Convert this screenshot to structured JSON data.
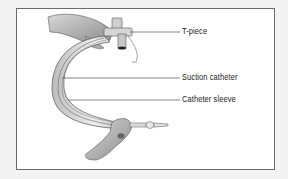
{
  "figure": {
    "labels": [
      {
        "id": "t-piece",
        "text": "T-piece"
      },
      {
        "id": "suction-catheter",
        "text": "Suction catheter"
      },
      {
        "id": "catheter-sleeve",
        "text": "Catheter sleeve"
      }
    ],
    "colors": {
      "border": "#6a6a6a",
      "background": "#ffffff",
      "outer": "#f3f3f3",
      "line": "#333333"
    }
  }
}
